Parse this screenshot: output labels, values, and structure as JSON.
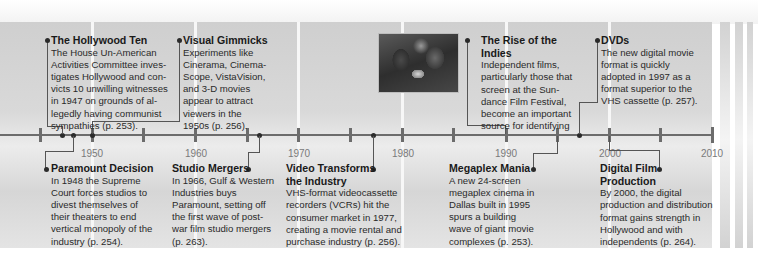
{
  "timeline": {
    "axis_years": [
      "1950",
      "1960",
      "1970",
      "1980",
      "1990",
      "2000",
      "2010"
    ],
    "range": [
      1945,
      2010
    ],
    "tick_interval_years": 5
  },
  "events_above": [
    {
      "title": "The Hollywood Ten",
      "body": "The House Un-American Activities Committee investigates Hollywood and convicts 10 unwilling witnesses in 1947 on grounds of allegedly having communist sympathies (p. 253).",
      "lines": [
        "The House Un-American",
        "Activities Committee inves-",
        "tigates Hollywood and con-",
        "victs 10 unwilling witnesses",
        "in 1947 on grounds of al-",
        "legedly having communist",
        "sympathies (p. 253)."
      ],
      "year": 1947
    },
    {
      "title": "Visual Gimmicks",
      "body": "Experiments like Cinerama, CinemaScope, VistaVision, and 3-D movies appear to attract viewers in the 1950s (p. 256).",
      "lines": [
        "Experiments like",
        "Cinerama, Cinema-",
        "Scope, VistaVision,",
        "and 3-D movies",
        "appear to attract",
        "viewers in the",
        "1950s (p. 256)."
      ],
      "year": 1950
    },
    {
      "title": "The Rise of the Indies",
      "title_lines": [
        "The Rise of the",
        "Indies"
      ],
      "body": "Independent films, particularly those that screen at the Sundance Film Festival, become an important source for identifying",
      "lines": [
        "Independent films,",
        "particularly those that",
        "screen at the Sun-",
        "dance Film Festival,",
        "become an important",
        "source for identifying"
      ],
      "year": 1990
    },
    {
      "title": "DVDs",
      "body": "The new digital movie format is quickly adopted in 1997 as a format superior to the VHS cassette (p. 257).",
      "lines": [
        "The new digital movie",
        "format is quickly",
        "adopted in 1997 as a",
        "format superior to the",
        "VHS cassette (p. 257)."
      ],
      "year": 1997
    }
  ],
  "events_below": [
    {
      "title": "Paramount Decision",
      "body": "In 1948 the Supreme Court forces studios to divest themselves of their theaters to end vertical monopoly of the industry (p. 254).",
      "lines": [
        "In 1948 the Supreme",
        "Court forces studios to",
        "divest themselves of",
        "their theaters to end",
        "vertical monopoly of the",
        "industry (p. 254)."
      ],
      "year": 1948
    },
    {
      "title": "Studio Mergers",
      "body": "In 1966, Gulf & Western Industries buys Paramount, setting off the first wave of postwar film studio mergers (p. 263).",
      "lines": [
        "In 1966, Gulf & Western",
        "Industries buys",
        "Paramount, setting off",
        "the first wave of post-",
        "war film studio mergers",
        "(p. 263)."
      ],
      "year": 1966
    },
    {
      "title": "Video Transforms the Industry",
      "title_lines": [
        "Video Transforms",
        "the Industry"
      ],
      "body": "VHS-format videocassette recorders (VCRs) hit the consumer market in 1977, creating a movie rental and purchase industry (p. 256).",
      "lines": [
        "VHS-format videocassette",
        "recorders (VCRs) hit the",
        "consumer market in 1977,",
        "creating a movie rental and",
        "purchase industry (p. 256)."
      ],
      "year": 1977
    },
    {
      "title": "Megaplex Mania",
      "body": "A new 24-screen megaplex cinema in Dallas built in 1995 spurs a building wave of giant movie complexes (p. 253).",
      "lines": [
        "A new 24-screen",
        "megaplex cinema in",
        "Dallas built in 1995",
        "spurs a building",
        "wave of giant movie",
        "complexes (p. 253)."
      ],
      "year": 1995
    },
    {
      "title": "Digital Film Production",
      "title_lines": [
        "Digital Film",
        "Production"
      ],
      "body": "By 2000, the digital production and distribution format gains strength in Hollywood and with independents (p. 264).",
      "lines": [
        "By 2000, the digital",
        "production and distribution",
        "format gains strength in",
        "Hollywood and with",
        "independents (p. 264)."
      ],
      "year": 2000
    }
  ],
  "photo": {
    "description": "two women facing each other (Sundance indie film still)"
  },
  "colors": {
    "band": "#d6d6d6",
    "axis": "#6c6c6c",
    "year_label": "#7a7a7a",
    "text": "#2a2a2a"
  }
}
